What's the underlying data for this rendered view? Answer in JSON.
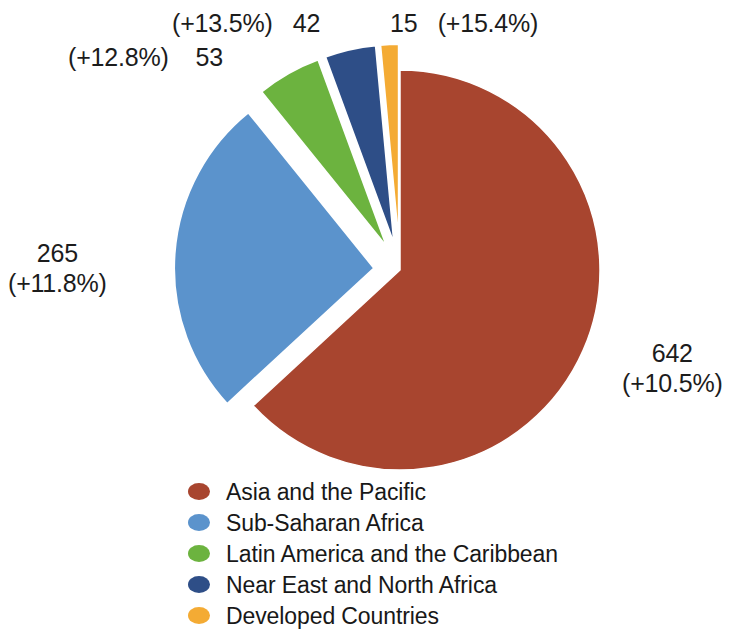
{
  "chart_data": {
    "type": "pie",
    "title": "",
    "subtitle": "",
    "xlabel": "",
    "ylabel": "",
    "units": "millions",
    "total": 1017,
    "legend_position": "bottom",
    "grid": false,
    "categories": [
      "Asia and the Pacific",
      "Sub-Saharan Africa",
      "Latin America and the Caribbean",
      "Near East and North Africa",
      "Developed Countries"
    ],
    "values": [
      642,
      265,
      53,
      42,
      15
    ],
    "annotations": [
      "(+10.5%)",
      "(+11.8%)",
      "(+12.8%)",
      "(+13.5%)",
      "(+15.4%)"
    ],
    "colors": [
      "#a8452f",
      "#5b93cc",
      "#6cb33f",
      "#2e4e87",
      "#f4ab34"
    ],
    "exploded": [
      false,
      true,
      true,
      true,
      true
    ],
    "slices": [
      {
        "label": "Asia and the Pacific",
        "value": 642,
        "value_text": "642",
        "change_text": "(+10.5%)",
        "percent": 63.1,
        "color": "#a8452f",
        "exploded": false
      },
      {
        "label": "Sub-Saharan Africa",
        "value": 265,
        "value_text": "265",
        "change_text": "(+11.8%)",
        "percent": 26.1,
        "color": "#5b93cc",
        "exploded": true
      },
      {
        "label": "Latin America and the Caribbean",
        "value": 53,
        "value_text": "53",
        "change_text": "(+12.8%)",
        "percent": 5.2,
        "color": "#6cb33f",
        "exploded": true
      },
      {
        "label": "Near East and North Africa",
        "value": 42,
        "value_text": "42",
        "change_text": "(+13.5%)",
        "percent": 4.1,
        "color": "#2e4e87",
        "exploded": true
      },
      {
        "label": "Developed Countries",
        "value": 15,
        "value_text": "15",
        "change_text": "(+15.4%)",
        "percent": 1.5,
        "color": "#f4ab34",
        "exploded": true
      }
    ]
  },
  "callouts": {
    "asia": {
      "value": "642",
      "change": "(+10.5%)"
    },
    "subsaharan": {
      "value": "265",
      "change": "(+11.8%)"
    },
    "latin": {
      "value": "53",
      "change": "(+12.8%)"
    },
    "neareast": {
      "value": "42",
      "change": "(+13.5%)"
    },
    "developed": {
      "value": "15",
      "change": "(+15.4%)"
    }
  },
  "legend": {
    "items": [
      {
        "label": "Asia and the Pacific",
        "color": "#a8452f"
      },
      {
        "label": "Sub-Saharan Africa",
        "color": "#5b93cc"
      },
      {
        "label": "Latin America and the Caribbean",
        "color": "#6cb33f"
      },
      {
        "label": "Near East and North Africa",
        "color": "#2e4e87"
      },
      {
        "label": "Developed Countries",
        "color": "#f4ab34"
      }
    ]
  }
}
